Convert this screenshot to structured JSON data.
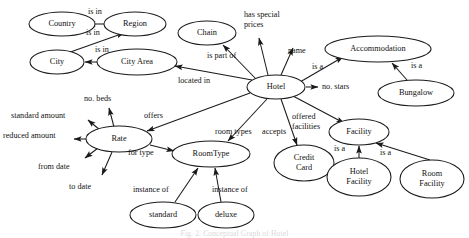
{
  "diagram": {
    "caption": "Fig. 2. Conceptual Graph of Hotel",
    "colors": {
      "stroke": "#1a1a1a",
      "fill": "#ffffff",
      "text": "#111111",
      "caption": "#d8d8d8"
    },
    "nodes": [
      {
        "id": "country",
        "label": "Country",
        "cx": 62,
        "cy": 24,
        "rx": 33,
        "ry": 12
      },
      {
        "id": "region",
        "label": "Region",
        "cx": 135,
        "cy": 24,
        "rx": 31,
        "ry": 12
      },
      {
        "id": "city",
        "label": "City",
        "cx": 57,
        "cy": 62,
        "rx": 27,
        "ry": 12
      },
      {
        "id": "cityarea",
        "label": "City Area",
        "cx": 137,
        "cy": 62,
        "rx": 40,
        "ry": 13
      },
      {
        "id": "chain",
        "label": "Chain",
        "cx": 207,
        "cy": 33,
        "rx": 29,
        "ry": 12
      },
      {
        "id": "hotel",
        "label": "Hotel",
        "cx": 276,
        "cy": 87,
        "rx": 29,
        "ry": 12
      },
      {
        "id": "accommodation",
        "label": "Accommodation",
        "cx": 378,
        "cy": 49,
        "rx": 53,
        "ry": 13
      },
      {
        "id": "bungalow",
        "label": "Bungalow",
        "cx": 416,
        "cy": 93,
        "rx": 38,
        "ry": 13
      },
      {
        "id": "rate",
        "label": "Rate",
        "cx": 119,
        "cy": 139,
        "rx": 33,
        "ry": 13
      },
      {
        "id": "roomtype",
        "label": "RoomType",
        "cx": 211,
        "cy": 154,
        "rx": 39,
        "ry": 13
      },
      {
        "id": "creditcard",
        "label": "Credit\nCard",
        "cx": 304,
        "cy": 163,
        "rx": 30,
        "ry": 18
      },
      {
        "id": "facility",
        "label": "Facility",
        "cx": 359,
        "cy": 132,
        "rx": 30,
        "ry": 13
      },
      {
        "id": "hotelfacility",
        "label": "Hotel\nFacility",
        "cx": 359,
        "cy": 177,
        "rx": 32,
        "ry": 19
      },
      {
        "id": "roomfacility",
        "label": "Room\nFacility",
        "cx": 432,
        "cy": 179,
        "rx": 32,
        "ry": 19
      },
      {
        "id": "standard",
        "label": "standard",
        "cx": 163,
        "cy": 215,
        "rx": 33,
        "ry": 13
      },
      {
        "id": "deluxe",
        "label": "deluxe",
        "cx": 226,
        "cy": 215,
        "rx": 28,
        "ry": 13
      }
    ],
    "edges": [
      {
        "id": "region-country",
        "label": "is in",
        "from": "Region",
        "to": "Country",
        "x1": 104,
        "y1": 24,
        "x2": 88,
        "y2": 24,
        "lx": 88,
        "ly": 12
      },
      {
        "id": "city-region",
        "label": "is in",
        "from": "City",
        "to": "Region",
        "x1": 62,
        "y1": 55,
        "x2": 124,
        "y2": 33,
        "lx": 86,
        "ly": 33
      },
      {
        "id": "cityarea-city",
        "label": "is in",
        "from": "City Area",
        "to": "City",
        "x1": 104,
        "y1": 62,
        "x2": 85,
        "y2": 62,
        "lx": 95,
        "ly": 50
      },
      {
        "id": "hotel-cityarea",
        "label": "located in",
        "from": "Hotel",
        "to": "City Area",
        "x1": 252,
        "y1": 80,
        "x2": 175,
        "y2": 66,
        "lx": 178,
        "ly": 81
      },
      {
        "id": "hotel-chain",
        "label": "is part of",
        "from": "Hotel",
        "to": "Chain",
        "x1": 256,
        "y1": 79,
        "x2": 223,
        "y2": 45,
        "lx": 207,
        "ly": 56
      },
      {
        "id": "hotel-special",
        "label": "has special\nprices",
        "from": "Hotel",
        "to": "",
        "x1": 268,
        "y1": 75,
        "x2": 259,
        "y2": 38,
        "lx": 244,
        "ly": 15
      },
      {
        "id": "hotel-name",
        "label": "name",
        "from": "Hotel",
        "to": "",
        "x1": 281,
        "y1": 75,
        "x2": 293,
        "y2": 48,
        "lx": 288,
        "ly": 51
      },
      {
        "id": "hotel-accom",
        "label": "is a",
        "from": "Hotel",
        "to": "Accommodation",
        "x1": 300,
        "y1": 82,
        "x2": 343,
        "y2": 57,
        "lx": 312,
        "ly": 67
      },
      {
        "id": "hotel-stars",
        "label": "no. stars",
        "from": "Hotel",
        "to": "",
        "x1": 306,
        "y1": 87,
        "x2": 318,
        "y2": 87,
        "lx": 322,
        "ly": 87
      },
      {
        "id": "bungalow-accom",
        "label": "is a",
        "from": "Bungalow",
        "to": "Accommodation",
        "x1": 407,
        "y1": 80,
        "x2": 392,
        "y2": 63,
        "lx": 411,
        "ly": 66
      },
      {
        "id": "hotel-offers",
        "label": "offers",
        "from": "Hotel",
        "to": "Rate",
        "x1": 250,
        "y1": 93,
        "x2": 147,
        "y2": 131,
        "lx": 144,
        "ly": 116
      },
      {
        "id": "hotel-roomtypes",
        "label": "room types",
        "from": "Hotel",
        "to": "RoomType",
        "x1": 267,
        "y1": 99,
        "x2": 228,
        "y2": 141,
        "lx": 215,
        "ly": 132
      },
      {
        "id": "hotel-accepts",
        "label": "accepts",
        "from": "Hotel",
        "to": "Credit Card",
        "x1": 281,
        "y1": 99,
        "x2": 297,
        "y2": 145,
        "lx": 262,
        "ly": 132
      },
      {
        "id": "hotel-offfac",
        "label": "offered\nfacilities",
        "from": "Hotel",
        "to": "Facility",
        "x1": 293,
        "y1": 96,
        "x2": 344,
        "y2": 123,
        "lx": 292,
        "ly": 117
      },
      {
        "id": "rate-stdamount",
        "label": "standard amount",
        "from": "Rate",
        "to": "",
        "x1": 100,
        "y1": 130,
        "x2": 88,
        "y2": 120,
        "lx": 11,
        "ly": 116
      },
      {
        "id": "rate-nobeds",
        "label": "no. beds",
        "from": "Rate",
        "to": "",
        "x1": 114,
        "y1": 127,
        "x2": 109,
        "y2": 108,
        "lx": 84,
        "ly": 99
      },
      {
        "id": "rate-reduced",
        "label": "reduced amount",
        "from": "Rate",
        "to": "",
        "x1": 86,
        "y1": 139,
        "x2": 74,
        "y2": 139,
        "lx": 3,
        "ly": 136
      },
      {
        "id": "rate-fromdate",
        "label": "from date",
        "from": "Rate",
        "to": "",
        "x1": 98,
        "y1": 148,
        "x2": 85,
        "y2": 158,
        "lx": 38,
        "ly": 167
      },
      {
        "id": "rate-todate",
        "label": "to date",
        "from": "Rate",
        "to": "",
        "x1": 112,
        "y1": 152,
        "x2": 102,
        "y2": 175,
        "lx": 69,
        "ly": 187
      },
      {
        "id": "rate-fortype",
        "label": "for type",
        "from": "Rate",
        "to": "RoomType",
        "x1": 150,
        "y1": 145,
        "x2": 174,
        "y2": 151,
        "lx": 128,
        "ly": 153
      },
      {
        "id": "standard-roomtype",
        "label": "instance of",
        "from": "standard",
        "to": "RoomType",
        "x1": 175,
        "y1": 202,
        "x2": 198,
        "y2": 168,
        "lx": 133,
        "ly": 190
      },
      {
        "id": "deluxe-roomtype",
        "label": "instance of",
        "from": "deluxe",
        "to": "RoomType",
        "x1": 221,
        "y1": 202,
        "x2": 215,
        "y2": 168,
        "lx": 212,
        "ly": 190
      },
      {
        "id": "hotelfac-facility",
        "label": "is a",
        "from": "Hotel Facility",
        "to": "Facility",
        "x1": 359,
        "y1": 158,
        "x2": 359,
        "y2": 146,
        "lx": 334,
        "ly": 149
      },
      {
        "id": "roomfac-facility",
        "label": "is a",
        "from": "Room Facility",
        "to": "Facility",
        "x1": 430,
        "y1": 160,
        "x2": 376,
        "y2": 143,
        "lx": 380,
        "ly": 153
      }
    ]
  }
}
